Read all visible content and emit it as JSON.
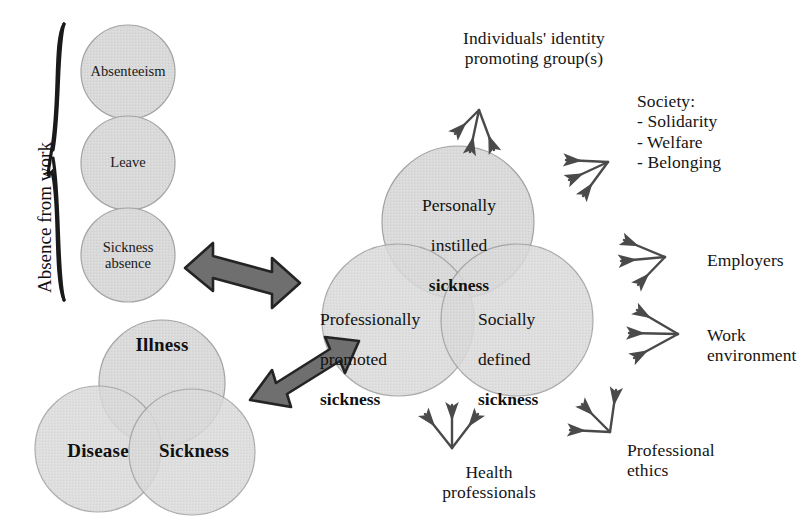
{
  "diagram": {
    "title_hidden": "",
    "colors": {
      "circle_fill": "#d9d9d9",
      "circle_stroke": "#9a9a9a",
      "overlap_fill": "#c2c2c2",
      "arrow_fill": "#6e6e6e",
      "arrow_stroke": "#2b2b2b",
      "thin_arrow": "#4a4a4a",
      "text": "#151515",
      "background": "#ffffff"
    },
    "absence_group": {
      "bracket_label": "Absence from work",
      "circles": [
        {
          "label": "Absenteeism",
          "cx": 128,
          "cy": 72,
          "r": 47
        },
        {
          "label": "Leave",
          "cx": 128,
          "cy": 163,
          "r": 47
        },
        {
          "label": "Sickness\nabsence",
          "cx": 128,
          "cy": 255,
          "r": 47
        }
      ]
    },
    "concept_venn": {
      "circles": [
        {
          "label": "Illness",
          "cx": 162,
          "cy": 383,
          "r": 63,
          "bold": true
        },
        {
          "label": "Disease",
          "cx": 98,
          "cy": 449,
          "r": 63,
          "bold": true
        },
        {
          "label": "Sickness",
          "cx": 192,
          "cy": 452,
          "r": 63,
          "bold": true
        }
      ]
    },
    "sickness_venn": {
      "circles": [
        {
          "line1": "Personally",
          "line2": "instilled",
          "line3": "sickness",
          "cx": 458,
          "cy": 222,
          "r": 76
        },
        {
          "line1": "Professionally",
          "line2": "promoted",
          "line3": "sickness",
          "cx": 398,
          "cy": 320,
          "r": 76
        },
        {
          "line1": "Socially",
          "line2": "defined",
          "line3": "sickness",
          "cx": 517,
          "cy": 320,
          "r": 76
        }
      ]
    },
    "double_arrows": [
      {
        "name": "absence-to-sickness-arrow"
      },
      {
        "name": "concepts-to-sickness-arrow"
      }
    ],
    "influences": [
      {
        "name": "individuals-identity",
        "label": "Individuals' identity\npromoting group(s)"
      },
      {
        "name": "society",
        "label": "Society:\n- Solidarity\n- Welfare\n- Belonging"
      },
      {
        "name": "employers",
        "label": "Employers"
      },
      {
        "name": "work-environment",
        "label": "Work\nenvironment"
      },
      {
        "name": "professional-ethics",
        "label": "Professional\nethics"
      },
      {
        "name": "health-professionals",
        "label": "Health\nprofessionals"
      }
    ]
  }
}
